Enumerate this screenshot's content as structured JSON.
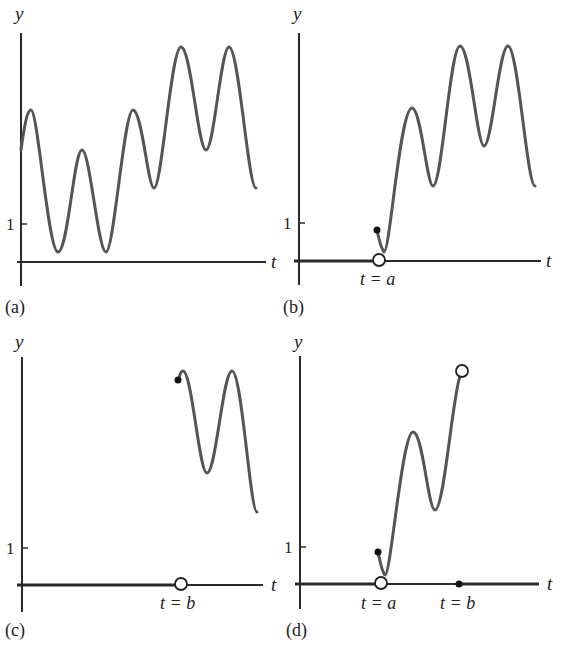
{
  "figure": {
    "panels": [
      {
        "id": "a",
        "label": "(a)",
        "y_axis_label": "y",
        "t_axis_label": "t",
        "tick_label": "1",
        "description": "Oscillating function y(t) over full time range"
      },
      {
        "id": "b",
        "label": "(b)",
        "y_axis_label": "y",
        "t_axis_label": "t",
        "tick_label": "1",
        "marker_label": "t = a",
        "description": "Function switched on at t = a (zero before, open circle at t=a on axis, filled dot at curve start)"
      },
      {
        "id": "c",
        "label": "(c)",
        "y_axis_label": "y",
        "t_axis_label": "t",
        "tick_label": "1",
        "marker_label": "t = b",
        "description": "Function switched on at t = b (zero before, open circle on axis, filled dot at curve start)"
      },
      {
        "id": "d",
        "label": "(d)",
        "y_axis_label": "y",
        "t_axis_label": "t",
        "tick_label": "1",
        "marker_label_a": "t = a",
        "marker_label_b": "t = b",
        "description": "Function on only between t = a and t = b (zero outside)"
      }
    ]
  }
}
